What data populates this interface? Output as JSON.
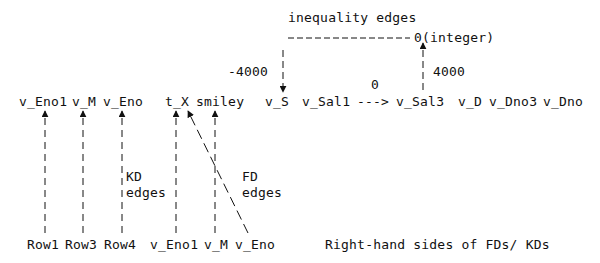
{
  "header": {
    "inequality_label": "inequality edges",
    "integer_node": "0(integer)",
    "weight_left": "-4000",
    "weight_middle": "0",
    "weight_right": "4000"
  },
  "main_row": {
    "nodes": [
      "v_Eno1",
      "v_M",
      "v_Eno",
      "t_X",
      "smiley",
      "v_S",
      "v_Sal1",
      "--->",
      "v_Sal3",
      "v_D",
      "v_Dno3",
      "v_Dno"
    ]
  },
  "edge_labels": {
    "kd_line1": "KD",
    "kd_line2": "edges",
    "fd_line1": "FD",
    "fd_line2": "edges"
  },
  "bottom_row": {
    "nodes": [
      "Row1",
      "Row3",
      "Row4",
      "v_Eno1",
      "v_M",
      "v_Eno"
    ],
    "caption": "Right-hand sides of FDs/ KDs"
  },
  "colors": {
    "ink": "#111111",
    "background": "#ffffff"
  }
}
